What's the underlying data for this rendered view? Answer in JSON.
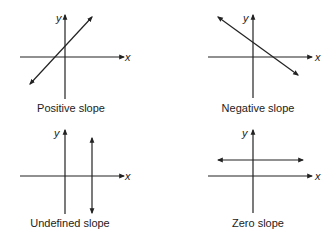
{
  "panels": [
    {
      "id": "positive",
      "caption": "Positive slope",
      "x_label": "x",
      "y_label": "y",
      "line_type": "positive"
    },
    {
      "id": "negative",
      "caption": "Negative slope",
      "x_label": "x",
      "y_label": "y",
      "line_type": "negative"
    },
    {
      "id": "undefined",
      "caption": "Undefined slope",
      "x_label": "x",
      "y_label": "y",
      "line_type": "vertical"
    },
    {
      "id": "zero",
      "caption": "Zero slope",
      "x_label": "x",
      "y_label": "y",
      "line_type": "horizontal"
    }
  ],
  "colors": {
    "line": "#222222",
    "background": "#ffffff"
  }
}
